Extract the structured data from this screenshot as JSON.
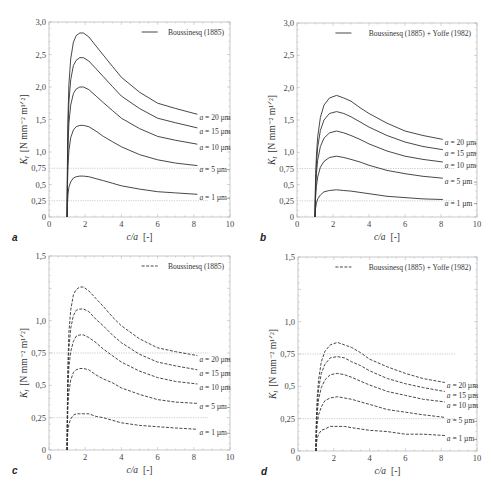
{
  "figure": {
    "panels": [
      {
        "letter": "a",
        "legend": "Boussinesq (1885)",
        "ylabel": "K",
        "ylabel_sub": "I",
        "ylabel_unit": "[N mm⁻² m¹ᐟ²]",
        "xlabel": "c/a",
        "xlabel_unit": "[-]"
      },
      {
        "letter": "b",
        "legend": "Boussinesq (1885) + Yoffe (1982)",
        "ylabel": "K",
        "ylabel_sub": "I",
        "ylabel_unit": "[N mm⁻² m¹ᐟ²]",
        "xlabel": "c/a",
        "xlabel_unit": "[-]"
      },
      {
        "letter": "c",
        "legend": "Boussinesq (1885)",
        "ylabel": "K",
        "ylabel_sub": "I",
        "ylabel_unit": "[N mm⁻² m¹ᐟ²]",
        "xlabel": "c/a",
        "xlabel_unit": "[-]"
      },
      {
        "letter": "d",
        "legend": "Boussinesq (1885) + Yoffe (1982)",
        "ylabel": "K",
        "ylabel_sub": "I",
        "ylabel_unit": "[N mm⁻² m¹ᐟ²]",
        "xlabel": "c/a",
        "xlabel_unit": "[-]"
      }
    ]
  },
  "chart_data": [
    {
      "type": "line",
      "panel": "a",
      "title": "",
      "legend": [
        "Boussinesq (1885)"
      ],
      "line_style": "solid",
      "xlabel": "c/a [-]",
      "ylabel": "K_I [N mm^-2 m^1/2]",
      "xlim": [
        0,
        10
      ],
      "ylim": [
        0,
        3.0
      ],
      "xticks": [
        "0",
        "2",
        "4",
        "6",
        "8",
        "10"
      ],
      "yticks": [
        "0",
        "0,25",
        "0,5",
        "0,75",
        "1,0",
        "1,5",
        "2,0",
        "2,5",
        "3,0"
      ],
      "reference_lines": [
        0.25,
        0.75
      ],
      "x": [
        1.0,
        1.02,
        1.05,
        1.1,
        1.2,
        1.35,
        1.5,
        1.7,
        1.9,
        2.2,
        2.6,
        3.0,
        3.5,
        4.0,
        5.0,
        6.0,
        7.0,
        8.2
      ],
      "series": [
        {
          "name": "a = 20 µm",
          "values": [
            0,
            0.99,
            1.56,
            2.04,
            2.43,
            2.69,
            2.79,
            2.83,
            2.83,
            2.77,
            2.63,
            2.49,
            2.32,
            2.15,
            1.92,
            1.75,
            1.67,
            1.58
          ]
        },
        {
          "name": "a = 15 µm",
          "values": [
            0,
            0.86,
            1.35,
            1.77,
            2.11,
            2.33,
            2.41,
            2.45,
            2.45,
            2.4,
            2.28,
            2.16,
            2.01,
            1.86,
            1.67,
            1.52,
            1.45,
            1.37
          ]
        },
        {
          "name": "a = 10 µm",
          "values": [
            0,
            0.7,
            1.1,
            1.44,
            1.72,
            1.9,
            1.97,
            2.0,
            2.0,
            1.96,
            1.86,
            1.76,
            1.64,
            1.52,
            1.36,
            1.24,
            1.18,
            1.12
          ]
        },
        {
          "name": "a = 5 µm",
          "values": [
            0,
            0.5,
            0.78,
            1.02,
            1.22,
            1.34,
            1.39,
            1.41,
            1.41,
            1.39,
            1.32,
            1.24,
            1.16,
            1.08,
            0.96,
            0.88,
            0.83,
            0.79
          ]
        },
        {
          "name": "a = 1 µm",
          "values": [
            0,
            0.22,
            0.35,
            0.46,
            0.54,
            0.6,
            0.62,
            0.63,
            0.63,
            0.62,
            0.59,
            0.56,
            0.52,
            0.48,
            0.43,
            0.39,
            0.37,
            0.35
          ]
        }
      ]
    },
    {
      "type": "line",
      "panel": "b",
      "title": "",
      "legend": [
        "Boussinesq (1885) + Yoffe (1982)"
      ],
      "line_style": "solid",
      "xlabel": "c/a [-]",
      "ylabel": "K_I [N mm^-2 m^1/2]",
      "xlim": [
        0,
        10
      ],
      "ylim": [
        0,
        3.0
      ],
      "xticks": [
        "0",
        "2",
        "4",
        "6",
        "8",
        "10"
      ],
      "yticks": [
        "0",
        "0,25",
        "0,5",
        "0,75",
        "1,0",
        "1,5",
        "2,0",
        "2,5",
        "3,0"
      ],
      "reference_lines": [
        0.25,
        0.75
      ],
      "x": [
        1.0,
        1.03,
        1.08,
        1.15,
        1.3,
        1.5,
        1.8,
        2.2,
        2.6,
        3.0,
        3.5,
        4.0,
        5.0,
        6.0,
        7.0,
        8.1
      ],
      "series": [
        {
          "name": "a = 20 µm",
          "values": [
            0,
            0.56,
            0.94,
            1.24,
            1.54,
            1.73,
            1.84,
            1.88,
            1.84,
            1.79,
            1.69,
            1.6,
            1.45,
            1.33,
            1.26,
            1.2
          ]
        },
        {
          "name": "a = 15 µm",
          "values": [
            0,
            0.49,
            0.82,
            1.08,
            1.34,
            1.5,
            1.6,
            1.63,
            1.6,
            1.55,
            1.47,
            1.39,
            1.26,
            1.16,
            1.09,
            1.04
          ]
        },
        {
          "name": "a = 10 µm",
          "values": [
            0,
            0.4,
            0.67,
            0.88,
            1.09,
            1.22,
            1.3,
            1.33,
            1.3,
            1.26,
            1.2,
            1.13,
            1.02,
            0.94,
            0.89,
            0.85
          ]
        },
        {
          "name": "a = 5 µm",
          "values": [
            0,
            0.28,
            0.47,
            0.62,
            0.77,
            0.86,
            0.92,
            0.94,
            0.92,
            0.89,
            0.85,
            0.8,
            0.72,
            0.67,
            0.63,
            0.6
          ]
        },
        {
          "name": "a = 1 µm",
          "values": [
            0,
            0.13,
            0.21,
            0.28,
            0.34,
            0.39,
            0.41,
            0.42,
            0.41,
            0.4,
            0.38,
            0.36,
            0.32,
            0.3,
            0.28,
            0.27
          ]
        }
      ]
    },
    {
      "type": "line",
      "panel": "c",
      "title": "",
      "legend": [
        "Boussinesq (1885)"
      ],
      "line_style": "dashed",
      "xlabel": "c/a [-]",
      "ylabel": "K_I [N mm^-2 m^1/2]",
      "xlim": [
        0,
        10
      ],
      "ylim": [
        0,
        1.5
      ],
      "xticks": [
        "0",
        "2",
        "4",
        "6",
        "8",
        "10"
      ],
      "yticks": [
        "0",
        "0,25",
        "0,5",
        "0,75",
        "1,0",
        "1,5"
      ],
      "reference_lines": [
        0.25,
        0.75
      ],
      "x": [
        1.0,
        1.02,
        1.05,
        1.1,
        1.2,
        1.35,
        1.5,
        1.7,
        1.9,
        2.2,
        2.6,
        3.0,
        3.5,
        4.0,
        5.0,
        6.0,
        7.0,
        8.2
      ],
      "series": [
        {
          "name": "a = 20 µm",
          "values": [
            0,
            0.44,
            0.69,
            0.91,
            1.08,
            1.2,
            1.24,
            1.26,
            1.26,
            1.23,
            1.17,
            1.11,
            1.03,
            0.96,
            0.86,
            0.79,
            0.76,
            0.73
          ]
        },
        {
          "name": "a = 15 µm",
          "values": [
            0,
            0.38,
            0.6,
            0.78,
            0.94,
            1.04,
            1.08,
            1.09,
            1.09,
            1.07,
            1.01,
            0.96,
            0.89,
            0.83,
            0.74,
            0.68,
            0.65,
            0.62
          ]
        },
        {
          "name": "a = 10 µm",
          "values": [
            0,
            0.31,
            0.49,
            0.64,
            0.76,
            0.84,
            0.88,
            0.89,
            0.89,
            0.87,
            0.83,
            0.78,
            0.73,
            0.68,
            0.61,
            0.56,
            0.53,
            0.51
          ]
        },
        {
          "name": "a = 5 µm",
          "values": [
            0,
            0.22,
            0.35,
            0.45,
            0.54,
            0.6,
            0.62,
            0.63,
            0.63,
            0.62,
            0.58,
            0.55,
            0.52,
            0.48,
            0.43,
            0.39,
            0.37,
            0.36
          ]
        },
        {
          "name": "a = 1 µm",
          "values": [
            0,
            0.1,
            0.15,
            0.2,
            0.24,
            0.27,
            0.28,
            0.28,
            0.28,
            0.28,
            0.26,
            0.25,
            0.23,
            0.21,
            0.19,
            0.18,
            0.17,
            0.16
          ]
        }
      ]
    },
    {
      "type": "line",
      "panel": "d",
      "title": "",
      "legend": [
        "Boussinesq (1885) + Yoffe (1982)"
      ],
      "line_style": "dashed",
      "xlabel": "c/a [-]",
      "ylabel": "K_I [N mm^-2 m^1/2]",
      "xlim": [
        0,
        10
      ],
      "ylim": [
        0,
        1.5
      ],
      "xticks": [
        "0",
        "2",
        "4",
        "6",
        "8",
        "10"
      ],
      "yticks": [
        "0",
        "0,25",
        "0,5",
        "0,75",
        "1,0",
        "1,5"
      ],
      "reference_lines": [
        0.25,
        0.75
      ],
      "x": [
        1.0,
        1.03,
        1.08,
        1.15,
        1.3,
        1.5,
        1.8,
        2.2,
        2.6,
        3.0,
        3.5,
        4.0,
        5.0,
        6.0,
        7.0,
        8.2
      ],
      "series": [
        {
          "name": "a = 20 µm",
          "values": [
            0,
            0.25,
            0.42,
            0.55,
            0.69,
            0.77,
            0.82,
            0.84,
            0.82,
            0.8,
            0.76,
            0.71,
            0.65,
            0.6,
            0.56,
            0.53
          ]
        },
        {
          "name": "a = 15 µm",
          "values": [
            0,
            0.22,
            0.36,
            0.48,
            0.6,
            0.67,
            0.72,
            0.73,
            0.72,
            0.69,
            0.66,
            0.62,
            0.56,
            0.52,
            0.49,
            0.46
          ]
        },
        {
          "name": "a = 10 µm",
          "values": [
            0,
            0.18,
            0.3,
            0.4,
            0.49,
            0.55,
            0.59,
            0.6,
            0.59,
            0.57,
            0.54,
            0.51,
            0.46,
            0.43,
            0.4,
            0.38
          ]
        },
        {
          "name": "a = 5 µm",
          "values": [
            0,
            0.13,
            0.21,
            0.28,
            0.34,
            0.39,
            0.41,
            0.42,
            0.41,
            0.4,
            0.38,
            0.36,
            0.32,
            0.3,
            0.28,
            0.26
          ]
        },
        {
          "name": "a = 1 µm",
          "values": [
            0,
            0.06,
            0.1,
            0.13,
            0.16,
            0.17,
            0.19,
            0.19,
            0.19,
            0.18,
            0.17,
            0.16,
            0.15,
            0.13,
            0.13,
            0.12
          ]
        }
      ]
    }
  ]
}
